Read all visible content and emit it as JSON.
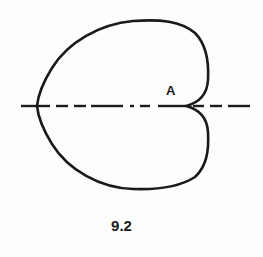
{
  "figure": {
    "point_label": "A",
    "caption": "9.2",
    "curve": "cardioid",
    "axis_style": "dashed",
    "stroke_color": "#1a1a1a",
    "background_color": "#fdfdfd"
  }
}
